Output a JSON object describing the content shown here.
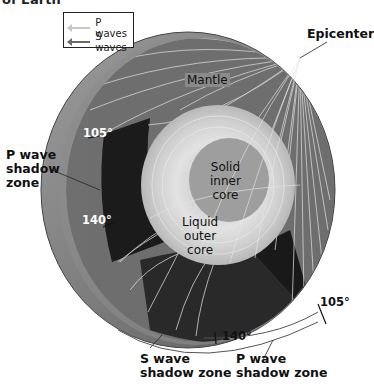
{
  "caption": {
    "partial_title": "of Earth"
  },
  "legend": {
    "items": [
      {
        "label": "P waves",
        "color": "#c8c8c8"
      },
      {
        "label": "S waves",
        "color": "#6a6a6a"
      }
    ]
  },
  "labels": {
    "epicenter": "Epicenter",
    "mantle": "Mantle",
    "solid_inner_core": [
      "Solid",
      "inner",
      "core"
    ],
    "liquid_outer_core": [
      "Liquid",
      "outer",
      "core"
    ],
    "p_shadow_left": [
      "P wave",
      "shadow",
      "zone"
    ],
    "s_shadow_bottom": [
      "S wave",
      "shadow zone"
    ],
    "p_shadow_bottom": [
      "P wave",
      "shadow zone"
    ]
  },
  "angles": {
    "left_105": "105°",
    "left_140": "140°",
    "bottom_140": "140°",
    "right_105": "105°"
  },
  "colors": {
    "mantle": "#6f6f6f",
    "shadow": "#1c1c1c",
    "outer_core": "#d6d6d6",
    "inner_core": "#9a9a9a",
    "crust": "#8a8a8a",
    "wave_line": "#e8e8e8"
  }
}
